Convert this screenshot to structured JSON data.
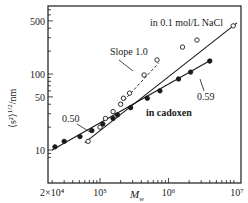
{
  "chart_data": {
    "type": "scatter",
    "title": "",
    "xlabel": "M_w",
    "ylabel": "⟨s²⟩^1/2/nm",
    "xscale": "log",
    "yscale": "log",
    "xlim": [
      15000,
      11000000
    ],
    "ylim": [
      7.5,
      700
    ],
    "x_ticks": [
      {
        "value": 20000,
        "label": "2×10⁴"
      },
      {
        "value": 100000,
        "label": "10⁵"
      },
      {
        "value": 1000000,
        "label": "10⁶"
      },
      {
        "value": 10000000,
        "label": "10⁷"
      }
    ],
    "y_ticks": [
      {
        "value": 10,
        "label": "10"
      },
      {
        "value": 50,
        "label": "50"
      },
      {
        "value": 100,
        "label": "100"
      },
      {
        "value": 500,
        "label": "500"
      }
    ],
    "grid": false,
    "series": [
      {
        "name": "in 0.1 mol/L NaCl",
        "marker": "open-circle",
        "x": [
          67000,
          100000,
          120000,
          155000,
          200000,
          220000,
          270000,
          440000,
          680000,
          1600000,
          2600000,
          8800000
        ],
        "y": [
          13,
          20,
          26,
          32,
          40,
          48,
          56,
          97,
          153,
          226,
          280,
          430
        ],
        "fit_line": {
          "x": [
            60000,
            10000000
          ],
          "y": [
            12.5,
            470
          ]
        }
      },
      {
        "name": "in cadoxen",
        "marker": "filled-circle",
        "x": [
          22000,
          30000,
          51000,
          76000,
          110000,
          155000,
          180000,
          280000,
          490000,
          750000,
          1400000,
          2100000,
          4000000
        ],
        "y": [
          11,
          13,
          15,
          18,
          22,
          26,
          29,
          36,
          48,
          60,
          86,
          106,
          148
        ],
        "fit_line": {
          "x": [
            20000,
            4300000
          ],
          "y": [
            10,
            155
          ]
        }
      }
    ],
    "reference_line": {
      "name": "Slope 1.0",
      "x": [
        200000,
        720000
      ],
      "y": [
        40,
        140
      ],
      "style": "dashed"
    },
    "annotations": [
      {
        "text": "in 0.1 mol/L NaCl",
        "x": 1400000,
        "y": 380
      },
      {
        "text": "Slope 1.0",
        "x": 330000,
        "y": 170
      },
      {
        "text": "0.59",
        "x": 2400000,
        "y": 60
      },
      {
        "text": "0.50",
        "x": 42000,
        "y": 24
      },
      {
        "text": "in cadoxen",
        "x": 420000,
        "y": 33
      }
    ]
  },
  "labels": {
    "nacl": "in 0.1 mol/L NaCl",
    "slope": "Slope 1.0",
    "exp059": "0.59",
    "exp050": "0.50",
    "cadoxen": "in cadoxen",
    "ylabel_main": "⟨s²⟩",
    "ylabel_sup": "1/2",
    "ylabel_unit": "/nm",
    "xlabel_main": "M",
    "xlabel_sub": "w"
  }
}
